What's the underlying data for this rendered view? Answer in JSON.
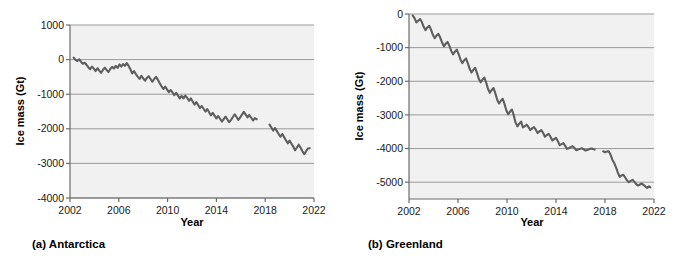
{
  "figure": {
    "panels": [
      {
        "id": "antarctica",
        "caption": "(a) Antarctica",
        "xlabel": "Year",
        "ylabel": "Ice mass (Gt)"
      },
      {
        "id": "greenland",
        "caption": "(b) Greenland",
        "xlabel": "Year",
        "ylabel": "Ice mass (Gt)"
      }
    ],
    "colors": {
      "plot_background": "#f1f1f1",
      "gridline": "#9a9a9a",
      "axis": "#6b6b6b",
      "series": "#5e5e5e",
      "text": "#000000"
    }
  },
  "chart_data": [
    {
      "type": "line",
      "title": "(a) Antarctica",
      "xlabel": "Year",
      "ylabel": "Ice mass (Gt)",
      "xlim": [
        2002,
        2022
      ],
      "ylim": [
        -4000,
        1000
      ],
      "xticks": [
        2002,
        2006,
        2010,
        2014,
        2018,
        2022
      ],
      "xtick_labels": [
        "2002",
        "2006",
        "2010",
        "2014",
        "2018",
        "2022"
      ],
      "yticks": [
        1000,
        0,
        -1000,
        -2000,
        -3000,
        -4000
      ],
      "ytick_labels": [
        "1000",
        "0",
        "-1000",
        "-2000",
        "-3000",
        "-4000"
      ],
      "grid": true,
      "legend": "none",
      "series": [
        {
          "name": "GRACE",
          "x": [
            2002.3,
            2002.45,
            2002.6,
            2002.75,
            2002.9,
            2003.05,
            2003.2,
            2003.35,
            2003.5,
            2003.65,
            2003.8,
            2003.95,
            2004.1,
            2004.25,
            2004.4,
            2004.55,
            2004.7,
            2004.85,
            2005.0,
            2005.15,
            2005.3,
            2005.45,
            2005.6,
            2005.75,
            2005.9,
            2006.05,
            2006.2,
            2006.35,
            2006.5,
            2006.65,
            2006.8,
            2006.95,
            2007.1,
            2007.25,
            2007.4,
            2007.55,
            2007.7,
            2007.85,
            2008.0,
            2008.15,
            2008.3,
            2008.45,
            2008.6,
            2008.75,
            2008.9,
            2009.05,
            2009.2,
            2009.35,
            2009.5,
            2009.65,
            2009.8,
            2009.95,
            2010.1,
            2010.25,
            2010.4,
            2010.55,
            2010.7,
            2010.85,
            2011.0,
            2011.15,
            2011.3,
            2011.45,
            2011.6,
            2011.75,
            2011.9,
            2012.05,
            2012.2,
            2012.35,
            2012.5,
            2012.65,
            2012.8,
            2012.95,
            2013.1,
            2013.25,
            2013.4,
            2013.55,
            2013.7,
            2013.85,
            2014.0,
            2014.15,
            2014.3,
            2014.45,
            2014.6,
            2014.75,
            2014.9,
            2015.05,
            2015.2,
            2015.35,
            2015.5,
            2015.65,
            2015.8,
            2015.95,
            2016.1,
            2016.25,
            2016.4,
            2016.55,
            2016.7,
            2016.85,
            2017.0,
            2017.15,
            2017.3,
            2017.45
          ],
          "y": [
            60,
            -10,
            -40,
            10,
            -60,
            -120,
            -90,
            -150,
            -220,
            -280,
            -200,
            -260,
            -330,
            -250,
            -320,
            -380,
            -300,
            -230,
            -300,
            -360,
            -270,
            -210,
            -260,
            -180,
            -240,
            -140,
            -200,
            -130,
            -180,
            -100,
            -180,
            -280,
            -400,
            -330,
            -420,
            -490,
            -560,
            -470,
            -540,
            -610,
            -530,
            -480,
            -560,
            -640,
            -560,
            -500,
            -580,
            -680,
            -770,
            -850,
            -780,
            -860,
            -940,
            -880,
            -950,
            -1030,
            -960,
            -1040,
            -1120,
            -1050,
            -1120,
            -1040,
            -1100,
            -1190,
            -1120,
            -1210,
            -1300,
            -1230,
            -1310,
            -1400,
            -1340,
            -1420,
            -1500,
            -1430,
            -1520,
            -1610,
            -1540,
            -1620,
            -1700,
            -1630,
            -1710,
            -1790,
            -1720,
            -1650,
            -1730,
            -1810,
            -1740,
            -1660,
            -1580,
            -1660,
            -1740,
            -1670,
            -1590,
            -1510,
            -1590,
            -1670,
            -1600,
            -1680,
            -1760,
            -1690,
            -1720
          ]
        },
        {
          "name": "GRACE-FO",
          "x": [
            2018.35,
            2018.5,
            2018.65,
            2018.8,
            2018.95,
            2019.1,
            2019.25,
            2019.4,
            2019.55,
            2019.7,
            2019.85,
            2020.0,
            2020.15,
            2020.3,
            2020.45,
            2020.6,
            2020.75,
            2020.9,
            2021.05,
            2021.2,
            2021.35,
            2021.5,
            2021.65
          ],
          "y": [
            -1880,
            -1960,
            -2050,
            -1980,
            -2060,
            -2150,
            -2230,
            -2150,
            -2240,
            -2330,
            -2420,
            -2340,
            -2430,
            -2520,
            -2620,
            -2540,
            -2460,
            -2550,
            -2650,
            -2730,
            -2650,
            -2570,
            -2560
          ]
        }
      ]
    },
    {
      "type": "line",
      "title": "(b) Greenland",
      "xlabel": "Year",
      "ylabel": "Ice mass (Gt)",
      "xlim": [
        2002,
        2022
      ],
      "ylim": [
        -5500,
        0
      ],
      "xticks": [
        2002,
        2006,
        2010,
        2014,
        2018,
        2022
      ],
      "xtick_labels": [
        "2002",
        "2006",
        "2010",
        "2014",
        "2018",
        "2022"
      ],
      "yticks": [
        0,
        -1000,
        -2000,
        -3000,
        -4000,
        -5000
      ],
      "ytick_labels": [
        "0",
        "-1000",
        "-2000",
        "-3000",
        "-4000",
        "-5000"
      ],
      "grid": true,
      "legend": "none",
      "series": [
        {
          "name": "GRACE",
          "x": [
            2002.3,
            2002.45,
            2002.6,
            2002.75,
            2002.9,
            2003.05,
            2003.2,
            2003.35,
            2003.5,
            2003.65,
            2003.8,
            2003.95,
            2004.1,
            2004.25,
            2004.4,
            2004.55,
            2004.7,
            2004.85,
            2005.0,
            2005.15,
            2005.3,
            2005.45,
            2005.6,
            2005.75,
            2005.9,
            2006.05,
            2006.2,
            2006.35,
            2006.5,
            2006.65,
            2006.8,
            2006.95,
            2007.1,
            2007.25,
            2007.4,
            2007.55,
            2007.7,
            2007.85,
            2008.0,
            2008.15,
            2008.3,
            2008.45,
            2008.6,
            2008.75,
            2008.9,
            2009.05,
            2009.2,
            2009.35,
            2009.5,
            2009.65,
            2009.8,
            2009.95,
            2010.1,
            2010.25,
            2010.4,
            2010.55,
            2010.7,
            2010.85,
            2011.0,
            2011.15,
            2011.3,
            2011.45,
            2011.6,
            2011.75,
            2011.9,
            2012.05,
            2012.2,
            2012.35,
            2012.5,
            2012.65,
            2012.8,
            2012.95,
            2013.1,
            2013.25,
            2013.4,
            2013.55,
            2013.7,
            2013.85,
            2014.0,
            2014.15,
            2014.3,
            2014.45,
            2014.6,
            2014.75,
            2014.9,
            2015.05,
            2015.2,
            2015.35,
            2015.5,
            2015.65,
            2015.8,
            2015.95,
            2016.1,
            2016.25,
            2016.4,
            2016.55,
            2016.7,
            2016.85,
            2017.0,
            2017.15,
            2017.3,
            2017.45
          ],
          "y": [
            -40,
            -120,
            -250,
            -200,
            -150,
            -240,
            -380,
            -480,
            -400,
            -350,
            -470,
            -620,
            -720,
            -640,
            -590,
            -700,
            -850,
            -960,
            -880,
            -830,
            -950,
            -1100,
            -1200,
            -1120,
            -1060,
            -1190,
            -1350,
            -1460,
            -1380,
            -1320,
            -1460,
            -1630,
            -1740,
            -1660,
            -1600,
            -1750,
            -1930,
            -2030,
            -1950,
            -1890,
            -2040,
            -2230,
            -2340,
            -2260,
            -2200,
            -2360,
            -2550,
            -2660,
            -2580,
            -2520,
            -2680,
            -2870,
            -2980,
            -2900,
            -2840,
            -3010,
            -3230,
            -3340,
            -3260,
            -3200,
            -3370,
            -3340,
            -3290,
            -3360,
            -3450,
            -3400,
            -3360,
            -3440,
            -3540,
            -3490,
            -3450,
            -3540,
            -3650,
            -3600,
            -3560,
            -3650,
            -3760,
            -3720,
            -3680,
            -3780,
            -3900,
            -3870,
            -3840,
            -3920,
            -4010,
            -3990,
            -3960,
            -3930,
            -3980,
            -4050,
            -4030,
            -4010,
            -3990,
            -4020,
            -4060,
            -4040,
            -4020,
            -4000,
            -4010,
            -4030
          ]
        },
        {
          "name": "GRACE-FO",
          "x": [
            2017.85,
            2018.0,
            2018.15,
            2018.3,
            2018.45,
            2018.6,
            2018.75,
            2018.9,
            2019.05,
            2019.2,
            2019.35,
            2019.5,
            2019.65,
            2019.8,
            2019.95,
            2020.1,
            2020.25,
            2020.4,
            2020.55,
            2020.7,
            2020.85,
            2021.0,
            2021.15,
            2021.3,
            2021.45,
            2021.6,
            2021.7
          ],
          "y": [
            -4080,
            -4110,
            -4090,
            -4080,
            -4180,
            -4330,
            -4430,
            -4560,
            -4720,
            -4840,
            -4800,
            -4780,
            -4860,
            -4950,
            -5000,
            -4960,
            -4930,
            -4990,
            -5060,
            -5100,
            -5070,
            -5040,
            -5080,
            -5130,
            -5170,
            -5120,
            -5150
          ]
        }
      ]
    }
  ]
}
